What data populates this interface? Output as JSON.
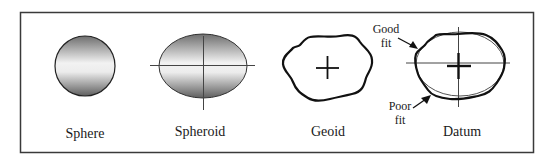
{
  "diagram": {
    "frame": {
      "stroke": "#3a3a3a"
    },
    "panels": [
      {
        "id": "sphere",
        "label": "Sphere"
      },
      {
        "id": "spheroid",
        "label": "Spheroid"
      },
      {
        "id": "geoid",
        "label": "Geoid"
      },
      {
        "id": "datum",
        "label": "Datum"
      }
    ],
    "annotations": {
      "good_fit": {
        "line1": "Good",
        "line2": "fit"
      },
      "poor_fit": {
        "line1": "Poor",
        "line2": "fit"
      }
    },
    "colors": {
      "gradient_dark": "#6e6e6e",
      "gradient_light": "#f2f2f2",
      "outline": "#111111",
      "thin_line": "#555555"
    }
  }
}
